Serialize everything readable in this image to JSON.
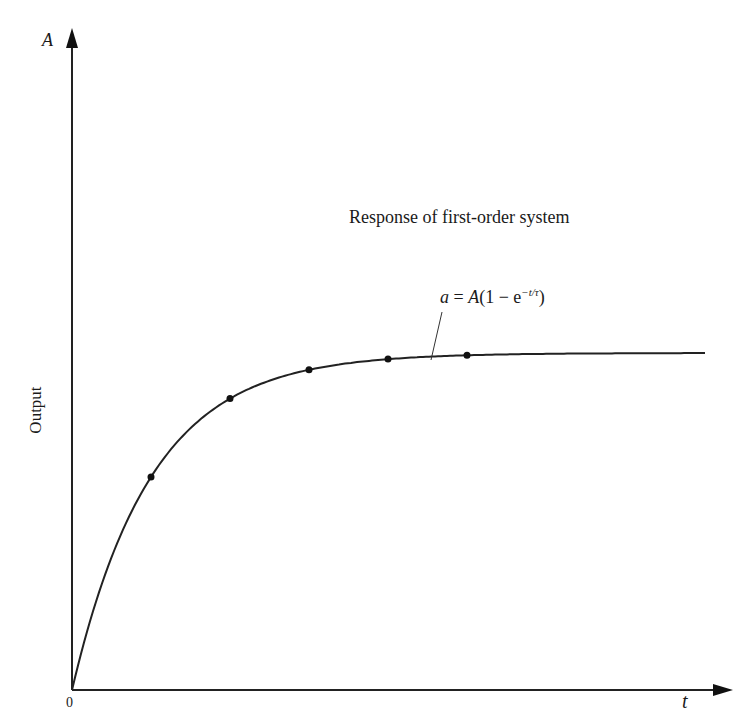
{
  "chart_data": {
    "type": "line",
    "title": "Response of first-order system",
    "xlabel": "t",
    "ylabel": "Output",
    "y_axis_top_label": "A",
    "origin_label": "0",
    "annotation": "a = A(1 − e^(−t/τ))",
    "function": "a = A(1 - exp(-t/tau))",
    "grid": false,
    "legend": null,
    "marked_points": [
      {
        "t_over_tau": 1,
        "a_over_A": 0.632
      },
      {
        "t_over_tau": 2,
        "a_over_A": 0.865
      },
      {
        "t_over_tau": 3,
        "a_over_A": 0.95
      },
      {
        "t_over_tau": 4,
        "a_over_A": 0.982
      },
      {
        "t_over_tau": 5,
        "a_over_A": 0.993
      }
    ],
    "x_range_tau": [
      0,
      8.3
    ],
    "y_range_A": [
      0,
      1.0
    ]
  },
  "labels": {
    "A": "A",
    "t": "t",
    "zero": "0",
    "output": "Output",
    "title": "Response of first-order system",
    "formula_main": "a = A(1 − e",
    "formula_sup": "−t/τ",
    "formula_close": ")"
  }
}
